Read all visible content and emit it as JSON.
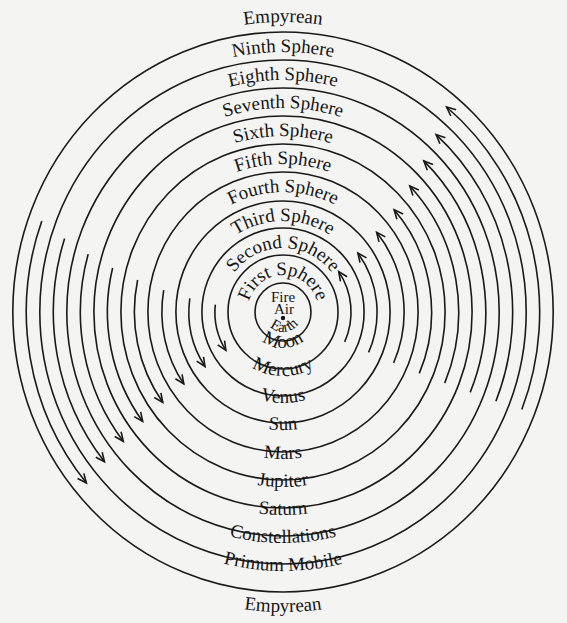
{
  "diagram": {
    "center": {
      "x": 283,
      "y": 312
    },
    "ring_radii_y": [
      29,
      57,
      84,
      111,
      140,
      168,
      196,
      224,
      252,
      280
    ],
    "aspect_x": 0.965,
    "top_labels": [
      "Empyrean",
      "Ninth Sphere",
      "Eighth Sphere",
      "Seventh Sphere",
      "Sixth Sphere",
      "Fifth Sphere",
      "Fourth Sphere",
      "Third Sphere",
      "Second Sphere",
      "First Sphere"
    ],
    "bottom_labels": [
      "Moon",
      "Mercury",
      "Venus",
      "Sun",
      "Mars",
      "Jupiter",
      "Saturn",
      "Constellations",
      "Primum Mobile",
      "Empyrean"
    ],
    "core_labels": {
      "fire": "Fire",
      "air": "Air",
      "earth": "Earth"
    },
    "arrows": {
      "left_direction": "downward (counter-clockwise motion on left side)",
      "right_direction": "upward",
      "count_left": 8,
      "count_right": 8
    },
    "colors": {
      "ink": "#1a1a1a",
      "paper": "#f4f4f2",
      "bleed_text": "#d9d9d7"
    }
  }
}
